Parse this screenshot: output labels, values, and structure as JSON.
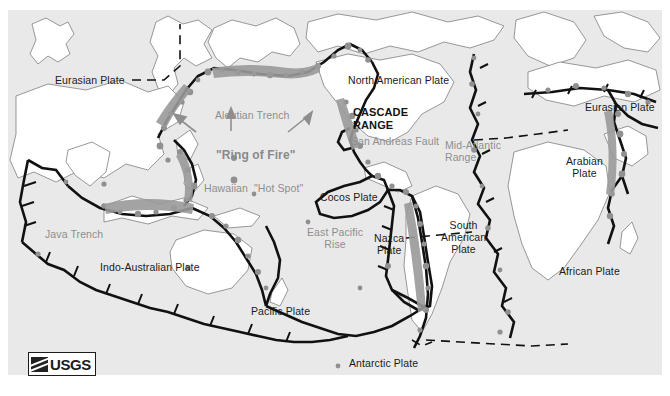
{
  "figure": {
    "attribution": "USGS",
    "ocean_color": "#e9e9e9",
    "land_color": "#ffffff",
    "boundary_color": "#111111",
    "volcano_color": "#8c8c8c",
    "feature_label_color": "#8e8e8e",
    "plate_label_color": "#1b1b1b"
  },
  "logo": {
    "mark_name": "usgs-wave-mark",
    "text": "USGS"
  },
  "plate_labels": [
    {
      "id": "eurasian-west",
      "text": "Eurasian Plate",
      "x": 47,
      "y": 64
    },
    {
      "id": "north-american",
      "text": "North American Plate",
      "x": 340,
      "y": 64
    },
    {
      "id": "eurasian-east",
      "text": "Eurasian Plate",
      "x": 577,
      "y": 91
    },
    {
      "id": "arabian",
      "text": "Arabian\nPlate",
      "x": 558,
      "y": 145
    },
    {
      "id": "cocos",
      "text": "Cocos Plate",
      "x": 312,
      "y": 181
    },
    {
      "id": "nazca",
      "text": "Nazca\nPlate",
      "x": 366,
      "y": 222
    },
    {
      "id": "south-american",
      "text": "South\nAmerican\nPlate",
      "x": 433,
      "y": 209
    },
    {
      "id": "african",
      "text": "African Plate",
      "x": 551,
      "y": 255
    },
    {
      "id": "indo-australian",
      "text": "Indo-Australian Plate",
      "x": 92,
      "y": 251
    },
    {
      "id": "pacific",
      "text": "Pacific Plate",
      "x": 243,
      "y": 295
    },
    {
      "id": "antarctic",
      "text": "Antarctic Plate",
      "x": 341,
      "y": 347
    }
  ],
  "feature_labels": [
    {
      "id": "aleutian-trench",
      "text": "Aleutian Trench",
      "x": 207,
      "y": 99,
      "style": "feature"
    },
    {
      "id": "ring-of-fire",
      "text": "\"Ring of Fire\"",
      "x": 208,
      "y": 139,
      "style": "feature-bold"
    },
    {
      "id": "hawaiian-hot-spot",
      "text": "Hawaiian  \"Hot Spot\"",
      "x": 196,
      "y": 172,
      "style": "feature"
    },
    {
      "id": "java-trench",
      "text": "Java Trench",
      "x": 37,
      "y": 218,
      "style": "feature"
    },
    {
      "id": "san-andreas-fault",
      "text": "San Andreas Fault",
      "x": 343,
      "y": 125,
      "style": "feature"
    },
    {
      "id": "mid-atlantic-range",
      "text": "Mid-Atlantic\nRange",
      "x": 437,
      "y": 129,
      "style": "feature"
    },
    {
      "id": "east-pacific-rise",
      "text": "East Pacific\nRise",
      "x": 299,
      "y": 216,
      "style": "feature"
    },
    {
      "id": "cascade-range",
      "text": "CASCADE\nRANGE",
      "x": 345,
      "y": 96,
      "style": "range"
    }
  ],
  "arrows": [
    {
      "id": "arrow-aleutian-up",
      "x1": 231,
      "y1": 131,
      "x2": 231,
      "y2": 113
    },
    {
      "id": "arrow-ring-left",
      "x1": 196,
      "y1": 132,
      "x2": 178,
      "y2": 117
    },
    {
      "id": "arrow-ring-right",
      "x1": 288,
      "y1": 132,
      "x2": 307,
      "y2": 115
    }
  ]
}
